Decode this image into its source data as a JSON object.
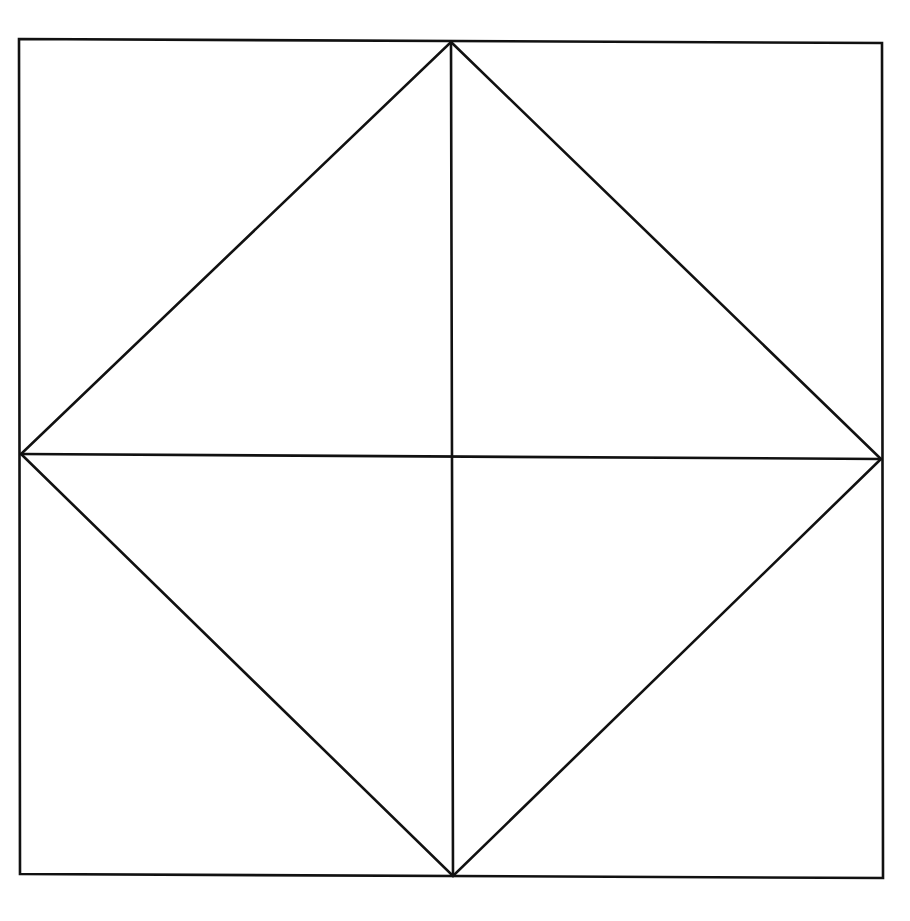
{
  "diagram": {
    "type": "geometric-figure",
    "stroke_color": "#111111",
    "background_color": "#ffffff",
    "outer_square": {
      "points": [
        [
          19,
          39
        ],
        [
          882,
          43
        ],
        [
          883,
          878
        ],
        [
          20,
          874
        ]
      ]
    },
    "diamond": {
      "points": [
        [
          451,
          42
        ],
        [
          881,
          459
        ],
        [
          453,
          876
        ],
        [
          21,
          454
        ]
      ]
    },
    "vertical_midline": {
      "x1": 451,
      "y1": 42,
      "x2": 453,
      "y2": 876
    },
    "horizontal_midline": {
      "x1": 21,
      "y1": 454,
      "x2": 881,
      "y2": 459
    },
    "labels": []
  }
}
